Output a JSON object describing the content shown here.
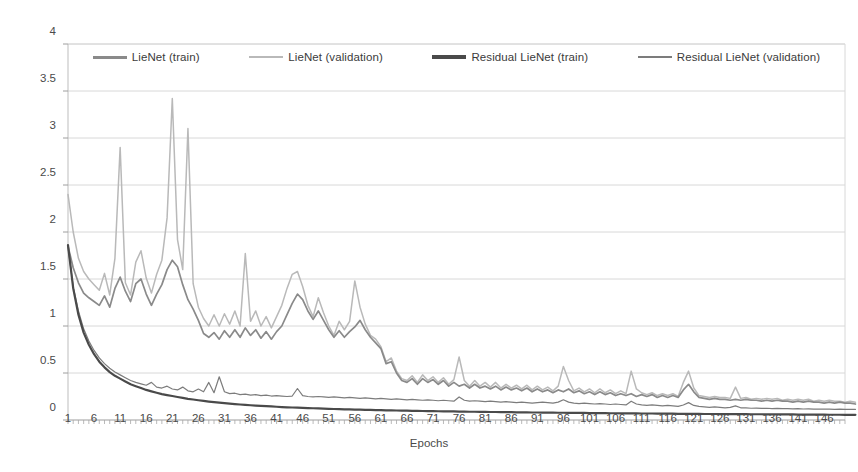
{
  "chart_data": {
    "type": "line",
    "title": "",
    "xlabel": "Epochs",
    "ylabel": "Objective",
    "xlim": [
      1,
      150
    ],
    "ylim": [
      0,
      4
    ],
    "grid": true,
    "legend_position": "top",
    "y_ticks": [
      "0",
      "0.5",
      "1",
      "1.5",
      "2",
      "2.5",
      "3",
      "3.5",
      "4"
    ],
    "y_tick_values": [
      0,
      0.5,
      1,
      1.5,
      2,
      2.5,
      3,
      3.5,
      4
    ],
    "x_ticks": [
      "1",
      "6",
      "11",
      "16",
      "21",
      "26",
      "31",
      "36",
      "41",
      "46",
      "51",
      "56",
      "61",
      "66",
      "71",
      "76",
      "81",
      "86",
      "91",
      "96",
      "101",
      "106",
      "111",
      "116",
      "121",
      "126",
      "131",
      "136",
      "141",
      "146"
    ],
    "x_tick_values": [
      1,
      6,
      11,
      16,
      21,
      26,
      31,
      36,
      41,
      46,
      51,
      56,
      61,
      66,
      71,
      76,
      81,
      86,
      91,
      96,
      101,
      106,
      111,
      116,
      121,
      126,
      131,
      136,
      141,
      146
    ],
    "colors": {
      "lienet_train": "#8a8a8a",
      "lienet_validation": "#b9b9b9",
      "residual_lienet_train": "#4a4a4a",
      "residual_lienet_validation": "#7c7c7c",
      "gridline": "#d8d8d8",
      "axis": "#bdbdbd",
      "background": "#ffffff"
    },
    "series": [
      {
        "name": "LieNet (train)",
        "key": "lienet_train",
        "values": [
          1.85,
          1.62,
          1.46,
          1.35,
          1.3,
          1.26,
          1.22,
          1.32,
          1.2,
          1.4,
          1.52,
          1.37,
          1.26,
          1.45,
          1.5,
          1.34,
          1.22,
          1.34,
          1.44,
          1.6,
          1.7,
          1.63,
          1.44,
          1.28,
          1.18,
          1.06,
          0.92,
          0.88,
          0.93,
          0.86,
          0.95,
          0.88,
          0.96,
          0.88,
          0.98,
          0.9,
          0.96,
          0.87,
          0.94,
          0.86,
          0.94,
          1.0,
          1.12,
          1.24,
          1.34,
          1.28,
          1.16,
          1.07,
          1.16,
          1.06,
          0.96,
          0.88,
          0.95,
          0.88,
          0.94,
          0.99,
          1.06,
          0.96,
          0.88,
          0.82,
          0.76,
          0.6,
          0.62,
          0.5,
          0.42,
          0.4,
          0.44,
          0.38,
          0.44,
          0.4,
          0.43,
          0.38,
          0.42,
          0.36,
          0.4,
          0.36,
          0.38,
          0.34,
          0.38,
          0.34,
          0.36,
          0.33,
          0.36,
          0.32,
          0.35,
          0.32,
          0.34,
          0.31,
          0.34,
          0.3,
          0.33,
          0.3,
          0.32,
          0.29,
          0.32,
          0.3,
          0.33,
          0.29,
          0.31,
          0.28,
          0.3,
          0.27,
          0.3,
          0.27,
          0.29,
          0.26,
          0.28,
          0.26,
          0.28,
          0.25,
          0.27,
          0.25,
          0.27,
          0.24,
          0.26,
          0.24,
          0.26,
          0.24,
          0.32,
          0.38,
          0.3,
          0.24,
          0.23,
          0.22,
          0.23,
          0.22,
          0.22,
          0.21,
          0.22,
          0.21,
          0.22,
          0.21,
          0.21,
          0.2,
          0.21,
          0.2,
          0.21,
          0.2,
          0.2,
          0.19,
          0.2,
          0.19,
          0.2,
          0.19,
          0.19,
          0.18,
          0.19,
          0.18,
          0.19,
          0.18,
          0.18,
          0.17
        ]
      },
      {
        "name": "LieNet (validation)",
        "key": "lienet_validation",
        "values": [
          2.4,
          2.0,
          1.72,
          1.58,
          1.5,
          1.44,
          1.38,
          1.56,
          1.33,
          1.72,
          2.9,
          1.46,
          1.33,
          1.68,
          1.8,
          1.51,
          1.35,
          1.55,
          1.7,
          2.15,
          3.42,
          1.92,
          1.6,
          3.1,
          1.45,
          1.2,
          1.08,
          1.0,
          1.12,
          1.0,
          1.13,
          1.02,
          1.16,
          1.0,
          1.77,
          1.05,
          1.16,
          1.0,
          1.1,
          0.98,
          1.1,
          1.22,
          1.4,
          1.55,
          1.58,
          1.42,
          1.22,
          1.1,
          1.3,
          1.14,
          1.0,
          0.9,
          1.05,
          0.96,
          1.05,
          1.48,
          1.2,
          1.02,
          0.9,
          0.86,
          0.78,
          0.62,
          0.66,
          0.52,
          0.44,
          0.42,
          0.47,
          0.4,
          0.48,
          0.42,
          0.46,
          0.4,
          0.45,
          0.38,
          0.43,
          0.67,
          0.42,
          0.36,
          0.42,
          0.36,
          0.4,
          0.35,
          0.4,
          0.34,
          0.38,
          0.34,
          0.37,
          0.33,
          0.37,
          0.32,
          0.36,
          0.32,
          0.35,
          0.31,
          0.36,
          0.57,
          0.42,
          0.31,
          0.34,
          0.3,
          0.33,
          0.29,
          0.33,
          0.29,
          0.32,
          0.28,
          0.31,
          0.28,
          0.52,
          0.33,
          0.29,
          0.27,
          0.29,
          0.26,
          0.28,
          0.26,
          0.28,
          0.25,
          0.4,
          0.52,
          0.34,
          0.26,
          0.25,
          0.24,
          0.25,
          0.24,
          0.24,
          0.23,
          0.35,
          0.23,
          0.24,
          0.22,
          0.23,
          0.22,
          0.23,
          0.22,
          0.23,
          0.21,
          0.22,
          0.21,
          0.22,
          0.21,
          0.22,
          0.2,
          0.21,
          0.2,
          0.21,
          0.2,
          0.2,
          0.19,
          0.2,
          0.19
        ]
      },
      {
        "name": "Residual LieNet (train)",
        "key": "residual_lienet_train",
        "values": [
          1.86,
          1.4,
          1.12,
          0.93,
          0.8,
          0.7,
          0.62,
          0.56,
          0.51,
          0.47,
          0.44,
          0.41,
          0.38,
          0.36,
          0.34,
          0.32,
          0.305,
          0.29,
          0.275,
          0.265,
          0.255,
          0.245,
          0.235,
          0.225,
          0.218,
          0.21,
          0.203,
          0.196,
          0.19,
          0.184,
          0.179,
          0.174,
          0.169,
          0.165,
          0.161,
          0.157,
          0.153,
          0.15,
          0.147,
          0.144,
          0.141,
          0.138,
          0.135,
          0.133,
          0.131,
          0.129,
          0.127,
          0.125,
          0.123,
          0.121,
          0.119,
          0.117,
          0.116,
          0.114,
          0.113,
          0.111,
          0.11,
          0.108,
          0.107,
          0.106,
          0.105,
          0.103,
          0.102,
          0.101,
          0.1,
          0.099,
          0.098,
          0.097,
          0.096,
          0.095,
          0.094,
          0.093,
          0.092,
          0.091,
          0.091,
          0.09,
          0.089,
          0.088,
          0.088,
          0.087,
          0.086,
          0.085,
          0.085,
          0.084,
          0.083,
          0.083,
          0.082,
          0.081,
          0.081,
          0.08,
          0.08,
          0.079,
          0.078,
          0.078,
          0.077,
          0.077,
          0.076,
          0.076,
          0.075,
          0.075,
          0.074,
          0.074,
          0.073,
          0.073,
          0.072,
          0.072,
          0.071,
          0.071,
          0.07,
          0.07,
          0.069,
          0.069,
          0.069,
          0.068,
          0.068,
          0.067,
          0.067,
          0.066,
          0.066,
          0.066,
          0.065,
          0.065,
          0.064,
          0.064,
          0.064,
          0.063,
          0.063,
          0.063,
          0.062,
          0.062,
          0.062,
          0.061,
          0.061,
          0.061,
          0.06,
          0.06,
          0.06,
          0.059,
          0.059,
          0.059,
          0.058,
          0.058,
          0.058,
          0.057,
          0.057,
          0.057,
          0.056,
          0.056,
          0.056,
          0.055,
          0.055,
          0.055
        ]
      },
      {
        "name": "Residual LieNet (validation)",
        "key": "residual_lienet_validation",
        "values": [
          1.84,
          1.42,
          1.16,
          0.97,
          0.84,
          0.74,
          0.66,
          0.6,
          0.55,
          0.51,
          0.48,
          0.45,
          0.42,
          0.4,
          0.385,
          0.37,
          0.4,
          0.35,
          0.34,
          0.36,
          0.33,
          0.32,
          0.35,
          0.31,
          0.3,
          0.33,
          0.3,
          0.4,
          0.29,
          0.46,
          0.3,
          0.28,
          0.285,
          0.27,
          0.275,
          0.265,
          0.27,
          0.26,
          0.265,
          0.255,
          0.26,
          0.255,
          0.25,
          0.255,
          0.335,
          0.26,
          0.25,
          0.245,
          0.25,
          0.245,
          0.24,
          0.245,
          0.24,
          0.235,
          0.24,
          0.235,
          0.23,
          0.235,
          0.23,
          0.225,
          0.23,
          0.225,
          0.22,
          0.225,
          0.22,
          0.215,
          0.22,
          0.215,
          0.21,
          0.215,
          0.21,
          0.205,
          0.21,
          0.205,
          0.2,
          0.245,
          0.21,
          0.2,
          0.205,
          0.2,
          0.195,
          0.2,
          0.195,
          0.19,
          0.195,
          0.19,
          0.185,
          0.19,
          0.185,
          0.18,
          0.185,
          0.19,
          0.185,
          0.18,
          0.19,
          0.215,
          0.19,
          0.18,
          0.175,
          0.18,
          0.175,
          0.17,
          0.175,
          0.17,
          0.165,
          0.17,
          0.165,
          0.16,
          0.2,
          0.17,
          0.16,
          0.155,
          0.16,
          0.155,
          0.15,
          0.155,
          0.15,
          0.145,
          0.16,
          0.185,
          0.155,
          0.145,
          0.14,
          0.135,
          0.14,
          0.135,
          0.13,
          0.135,
          0.15,
          0.13,
          0.128,
          0.125,
          0.127,
          0.123,
          0.125,
          0.121,
          0.123,
          0.12,
          0.121,
          0.118,
          0.12,
          0.117,
          0.119,
          0.116,
          0.117,
          0.115,
          0.116,
          0.114,
          0.115,
          0.113,
          0.114,
          0.112
        ]
      }
    ]
  },
  "legend": {
    "items": [
      {
        "label": "LieNet (train)",
        "key": "lienet_train"
      },
      {
        "label": "LieNet (validation)",
        "key": "lienet_validation"
      },
      {
        "label": "Residual LieNet (train)",
        "key": "residual_lienet_train"
      },
      {
        "label": "Residual LieNet (validation)",
        "key": "residual_lienet_validation"
      }
    ]
  }
}
